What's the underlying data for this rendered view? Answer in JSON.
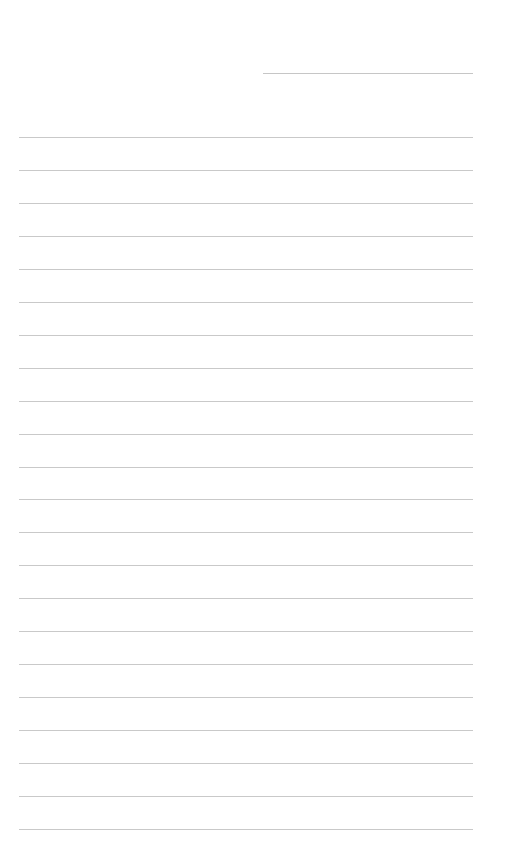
{
  "page": {
    "type": "blank-lined-sheet",
    "background_color": "#ffffff",
    "line_color": "#c9c9c9"
  },
  "header_line": {
    "left": 263,
    "top": 73,
    "width": 210,
    "text": ""
  },
  "ruled_lines": {
    "count": 22,
    "first_top": 137,
    "spacing": 32.95,
    "left": 19,
    "width": 454,
    "texts": [
      "",
      "",
      "",
      "",
      "",
      "",
      "",
      "",
      "",
      "",
      "",
      "",
      "",
      "",
      "",
      "",
      "",
      "",
      "",
      "",
      "",
      ""
    ]
  }
}
